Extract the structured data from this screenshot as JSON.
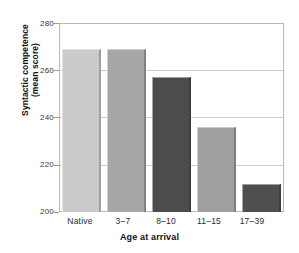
{
  "chart_data": {
    "type": "bar",
    "title": "",
    "categories": [
      "Native",
      "3–7",
      "8–10",
      "11–15",
      "17–39"
    ],
    "values": [
      269,
      269,
      257,
      236,
      212
    ],
    "series": [
      {
        "name": "Syntactic competence (mean score)",
        "values": [
          269,
          269,
          257,
          236,
          212
        ]
      }
    ],
    "xlabel": "Age at arrival",
    "ylabel": "Syntactic competence (mean score)",
    "ylabel_line1": "Syntactic competence",
    "ylabel_line2": "(mean score)",
    "ylim": [
      200,
      280
    ],
    "yticks": [
      200,
      220,
      240,
      260,
      280
    ],
    "ytick_labels": [
      "200",
      "220",
      "240",
      "260",
      "280"
    ],
    "grid": true,
    "grid_axis": "y",
    "legend": false,
    "legend_position": "none",
    "bar_colors": [
      "#cbcbcb",
      "#a6a6a6",
      "#4c4c4c",
      "#a0a0a0",
      "#4f4f4f"
    ],
    "frame_color": "#b9b9b9",
    "gridline_color": "#cfcfcf",
    "background": "#ffffff"
  }
}
